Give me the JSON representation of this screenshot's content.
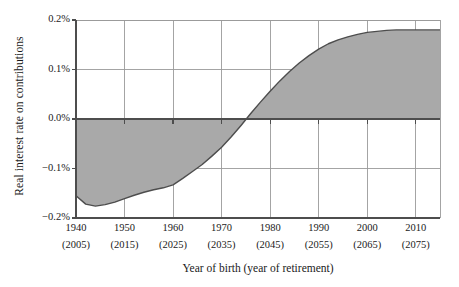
{
  "chart_data": {
    "type": "area",
    "title": "",
    "xlabel": "Year of birth (year of retirement)",
    "ylabel": "Real interest rate on contributions",
    "xlim": [
      1940,
      2015
    ],
    "ylim": [
      -0.2,
      0.2
    ],
    "grid": true,
    "legend": "none",
    "yticks": [
      "0.2%",
      "0.1%",
      "0.0%",
      "−0.1%",
      "−0.2%"
    ],
    "ytick_values": [
      0.2,
      0.1,
      0.0,
      -0.1,
      -0.2
    ],
    "xticks": [
      "1940",
      "1950",
      "1960",
      "1970",
      "1980",
      "1990",
      "2000",
      "2010"
    ],
    "xticks_sub": [
      "(2005)",
      "(2015)",
      "(2025)",
      "(2035)",
      "(2045)",
      "(2055)",
      "(2065)",
      "(2075)"
    ],
    "xtick_values": [
      1940,
      1950,
      1960,
      1970,
      1980,
      1990,
      2000,
      2010
    ],
    "series_name": "Real interest rate on contributions",
    "x": [
      1940,
      1942,
      1944,
      1946,
      1948,
      1950,
      1952,
      1954,
      1956,
      1958,
      1960,
      1962,
      1964,
      1966,
      1968,
      1970,
      1972,
      1974,
      1976,
      1978,
      1980,
      1982,
      1984,
      1986,
      1988,
      1990,
      1992,
      1994,
      1996,
      1998,
      2000,
      2002,
      2004,
      2006,
      2008,
      2010,
      2012,
      2015
    ],
    "values": [
      -0.155,
      -0.172,
      -0.176,
      -0.173,
      -0.168,
      -0.161,
      -0.154,
      -0.148,
      -0.143,
      -0.139,
      -0.133,
      -0.12,
      -0.106,
      -0.092,
      -0.075,
      -0.057,
      -0.036,
      -0.013,
      0.011,
      0.034,
      0.056,
      0.077,
      0.096,
      0.113,
      0.128,
      0.141,
      0.152,
      0.16,
      0.166,
      0.171,
      0.175,
      0.177,
      0.179,
      0.18,
      0.18,
      0.18,
      0.18,
      0.18
    ],
    "colors": {
      "fill": "#a9a9a9",
      "line": "#4d4d4d",
      "axis": "#4d4d4d",
      "grid": "#9a9a9a",
      "text": "#1a1a1a",
      "background": "#ffffff"
    }
  }
}
